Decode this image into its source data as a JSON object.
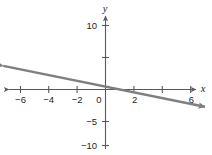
{
  "chart_data": {
    "type": "line",
    "title": "",
    "subtitle": "",
    "xlabel": "x",
    "ylabel": "y",
    "xlim": [
      -7.2,
      7.0
    ],
    "ylim": [
      -11.5,
      11.5
    ],
    "grid": false,
    "legend": null,
    "axis_style": "arrows-both-ends",
    "x_ticks": [
      -6,
      -4,
      -2,
      2,
      4,
      6
    ],
    "x_tick_labels": [
      "−6",
      "−4",
      "−2",
      "2",
      "",
      "6"
    ],
    "y_ticks": [
      -10,
      -5,
      5,
      10
    ],
    "y_tick_labels": [
      "−10",
      "−5",
      "",
      "10"
    ],
    "origin_label": "0",
    "series": [
      {
        "name": "line",
        "color": "#7f7f7f",
        "slope": -0.45,
        "intercept": 0.45,
        "x_intercept": 1,
        "y_intercept": 0.45,
        "arrow_start": true,
        "arrow_end": true,
        "x": [
          -7.2,
          7.0
        ],
        "values": [
          3.69,
          -2.7
        ]
      }
    ]
  },
  "colors": {
    "axis": "#58595b",
    "line": "#7f7f7f",
    "text": "#231f20",
    "background": "#ffffff"
  }
}
